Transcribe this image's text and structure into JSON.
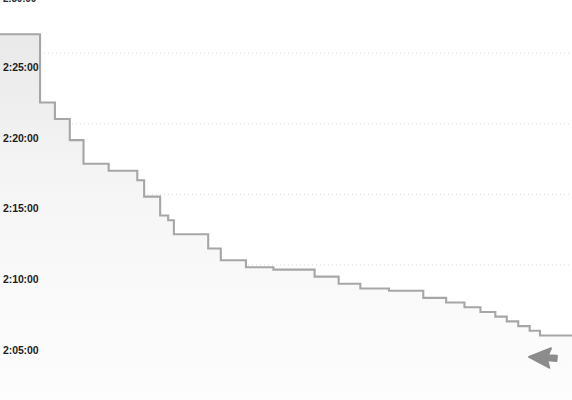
{
  "chart_data": {
    "type": "line",
    "subtype": "step-area",
    "title": "2:30:00",
    "xlabel": "",
    "ylabel": "",
    "legend": [],
    "grid": true,
    "grid_axis": "y",
    "grid_style": "dotted",
    "legend_position": "none",
    "y_axis": {
      "tick_labels": [
        "2:30:00",
        "2:25:00",
        "2:20:00",
        "2:15:00",
        "2:10:00",
        "2:05:00"
      ],
      "tick_values_seconds": [
        9000,
        8700,
        8400,
        8100,
        7800,
        7500
      ],
      "ylim_seconds": [
        7380,
        9000
      ],
      "ylim": [
        "2:03:00",
        "2:30:00"
      ],
      "direction": "descending",
      "interval": "5 minutes"
    },
    "x_axis": {
      "tick_labels": [
        "",
        "",
        "",
        "",
        "",
        ""
      ],
      "visible": false,
      "xlim": [
        0,
        100
      ]
    },
    "series": [
      {
        "name": "finish-time",
        "step": "post",
        "line_color": "#a6a6a6",
        "fill_color": "#f2f2f2",
        "x": [
          0.0,
          7.0,
          7.0,
          9.6,
          9.6,
          12.2,
          12.2,
          14.6,
          14.6,
          19.0,
          19.0,
          24.0,
          24.0,
          25.2,
          25.2,
          28.0,
          28.0,
          29.4,
          29.4,
          30.4,
          30.4,
          36.4,
          36.4,
          38.6,
          38.6,
          43.0,
          43.0,
          47.8,
          47.8,
          55.0,
          55.0,
          59.2,
          59.2,
          63.0,
          63.0,
          68.0,
          68.0,
          74.0,
          74.0,
          78.0,
          78.0,
          81.2,
          81.2,
          84.0,
          84.0,
          86.6,
          86.6,
          88.6,
          88.6,
          90.6,
          90.6,
          92.6,
          92.6,
          94.4,
          94.4,
          100.0
        ],
        "y_seconds": [
          8780,
          8780,
          8490,
          8490,
          8420,
          8420,
          8330,
          8330,
          8230,
          8230,
          8200,
          8200,
          8160,
          8160,
          8090,
          8090,
          8010,
          8010,
          7990,
          7990,
          7930,
          7930,
          7870,
          7870,
          7820,
          7820,
          7790,
          7790,
          7780,
          7780,
          7750,
          7750,
          7720,
          7720,
          7700,
          7700,
          7690,
          7690,
          7660,
          7660,
          7640,
          7640,
          7620,
          7620,
          7600,
          7600,
          7580,
          7580,
          7560,
          7560,
          7540,
          7540,
          7520,
          7520,
          7500,
          7500
        ],
        "y_labels": [
          "2:26:20",
          "2:26:20",
          "2:21:30",
          "2:21:30",
          "2:20:20",
          "2:20:20",
          "2:18:50",
          "2:18:50",
          "2:17:10",
          "2:17:10",
          "2:16:40",
          "2:16:40",
          "2:16:00",
          "2:16:00",
          "2:14:50",
          "2:14:50",
          "2:13:30",
          "2:13:30",
          "2:13:10",
          "2:13:10",
          "2:12:10",
          "2:12:10",
          "2:11:10",
          "2:11:10",
          "2:10:20",
          "2:10:20",
          "2:09:50",
          "2:09:50",
          "2:09:40",
          "2:09:40",
          "2:09:10",
          "2:09:10",
          "2:08:40",
          "2:08:40",
          "2:08:20",
          "2:08:20",
          "2:08:10",
          "2:08:10",
          "2:07:40",
          "2:07:40",
          "2:07:20",
          "2:07:20",
          "2:07:00",
          "2:07:00",
          "2:06:40",
          "2:06:40",
          "2:06:20",
          "2:06:20",
          "2:06:00",
          "2:06:00",
          "2:05:40",
          "2:05:40",
          "2:05:20",
          "2:05:20",
          "2:05:00",
          "2:05:00"
        ]
      }
    ]
  },
  "colors": {
    "background": "#ffffff",
    "line": "#a6a6a6",
    "fill_top": "#ececec",
    "fill_bottom": "#fdfdfd",
    "grid": "#d9d9d9",
    "label_text": "#1d1d1d",
    "cursor": "#8c8c8c"
  },
  "cursor": {
    "name": "mouse-pointer",
    "x": 529,
    "y": 357
  },
  "x_ticks_faint": [
    {
      "label": "",
      "x": 30
    },
    {
      "label": "",
      "x": 96
    },
    {
      "label": "",
      "x": 166
    },
    {
      "label": "",
      "x": 232
    },
    {
      "label": "",
      "x": 300
    },
    {
      "label": "",
      "x": 368
    }
  ]
}
